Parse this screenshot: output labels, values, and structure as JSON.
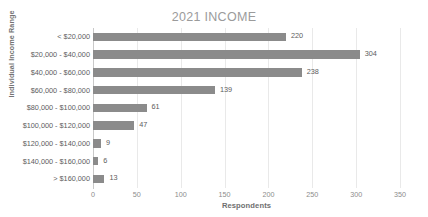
{
  "chart_data": {
    "type": "bar",
    "orientation": "horizontal",
    "title": "2021 INCOME",
    "xlabel": "Respondents",
    "ylabel": "Individual Income Range",
    "categories": [
      "< $20,000",
      "$20,000 - $40,000",
      "$40,000 - $60,000",
      "$60,000 - $80,000",
      "$80,000 - $100,000",
      "$100,000 - $120,000",
      "$120,000 - $140,000",
      "$140,000 - $160,000",
      "> $160,000"
    ],
    "values": [
      220,
      304,
      238,
      139,
      61,
      47,
      9,
      6,
      13
    ],
    "data_labels": [
      "220",
      "304",
      "238",
      "139",
      "61",
      "47",
      "9",
      "6",
      "13"
    ],
    "xlim": [
      0,
      350
    ],
    "xticks": [
      0,
      50,
      100,
      150,
      200,
      250,
      300,
      350
    ],
    "xtick_labels": [
      "0",
      "50",
      "100",
      "150",
      "200",
      "250",
      "300",
      "350"
    ],
    "grid": "vertical",
    "legend": "none",
    "bar_color": "#8b8b8b",
    "title_color": "#9b9b9b",
    "axis_text_color": "#5d5d5d",
    "gridline_color": "#e9e9e9"
  }
}
